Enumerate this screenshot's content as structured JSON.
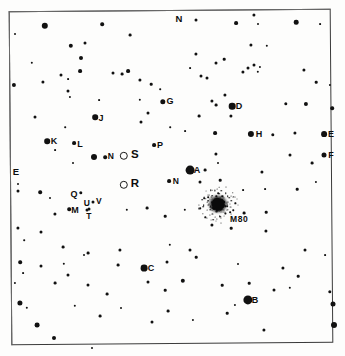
{
  "chart_data": {
    "type": "scatter",
    "xlabel": "",
    "ylabel": "",
    "xlim": [
      0,
      345
    ],
    "ylim": [
      0,
      356
    ],
    "grid": false,
    "legend": "none",
    "orientation_markers": [
      {
        "label": "N",
        "x": 179,
        "y": 19,
        "font_size": 9.5,
        "position": "top-center"
      },
      {
        "label": "E",
        "x": 16,
        "y": 172,
        "font_size": 9.5,
        "position": "left-edge"
      }
    ],
    "deep_sky_objects": [
      {
        "name": "M80",
        "type": "globular-cluster",
        "x": 218,
        "y": 204,
        "label": "M80",
        "label_x": 230,
        "label_y": 214,
        "core_radius": 6.5,
        "halo_radius": 20
      }
    ],
    "comparison_stars": [
      {
        "label": "A",
        "x": 197,
        "y": 170,
        "marker_x": 190,
        "marker_y": 170,
        "marker_size": 4.4,
        "marker": "filled",
        "font_size": 9
      },
      {
        "label": "B",
        "x": 255,
        "y": 300,
        "marker_x": 248,
        "marker_y": 300,
        "marker_size": 4.6,
        "marker": "filled",
        "font_size": 9
      },
      {
        "label": "C",
        "x": 151,
        "y": 268,
        "marker_x": 144,
        "marker_y": 268,
        "marker_size": 3.4,
        "marker": "filled",
        "font_size": 9
      },
      {
        "label": "D",
        "x": 239,
        "y": 106,
        "marker_x": 232,
        "marker_y": 106,
        "marker_size": 3.3,
        "marker": "filled",
        "font_size": 9
      },
      {
        "label": "E",
        "x": 331,
        "y": 134,
        "marker_x": 324,
        "marker_y": 134,
        "marker_size": 2.9,
        "marker": "filled",
        "font_size": 9
      },
      {
        "label": "F",
        "x": 331,
        "y": 155,
        "marker_x": 324,
        "marker_y": 155,
        "marker_size": 2.5,
        "marker": "filled",
        "font_size": 9
      },
      {
        "label": "G",
        "x": 170,
        "y": 101,
        "marker_x": 163,
        "marker_y": 102,
        "marker_size": 2.7,
        "marker": "filled",
        "font_size": 9
      },
      {
        "label": "H",
        "x": 259,
        "y": 134,
        "marker_x": 251,
        "marker_y": 134,
        "marker_size": 3.1,
        "marker": "filled",
        "font_size": 9
      },
      {
        "label": "J",
        "x": 101,
        "y": 118,
        "marker_x": 95,
        "marker_y": 117,
        "marker_size": 2.8,
        "marker": "filled",
        "font_size": 9
      },
      {
        "label": "K",
        "x": 54,
        "y": 141,
        "marker_x": 47,
        "marker_y": 141,
        "marker_size": 2.8,
        "marker": "filled",
        "font_size": 9
      },
      {
        "label": "L",
        "x": 80,
        "y": 144,
        "marker_x": 74,
        "marker_y": 143,
        "marker_size": 1.9,
        "marker": "filled",
        "font_size": 9
      },
      {
        "label": "M",
        "x": 75,
        "y": 210,
        "marker_x": 69,
        "marker_y": 209,
        "marker_size": 1.8,
        "marker": "filled",
        "font_size": 9
      },
      {
        "label": "P",
        "x": 160,
        "y": 145,
        "marker_x": 154,
        "marker_y": 145,
        "marker_size": 1.9,
        "marker": "filled",
        "font_size": 9
      },
      {
        "label": "Q",
        "x": 74,
        "y": 194,
        "marker_x": 81,
        "marker_y": 193,
        "marker_size": 1.7,
        "marker": "filled",
        "font_size": 9
      }
    ],
    "variable_stars": [
      {
        "label": "N",
        "x": 111,
        "y": 156,
        "marker_x": 105,
        "marker_y": 157,
        "marker_size": 1.8,
        "marker": "filled",
        "font_size": 8.5
      },
      {
        "label": "N",
        "x": 176,
        "y": 181,
        "marker_x": 169,
        "marker_y": 181,
        "marker_size": 1.9,
        "marker": "filled",
        "font_size": 8.5
      },
      {
        "label": "S",
        "x": 135,
        "y": 155,
        "marker_x": 124,
        "marker_y": 156,
        "marker_size": 4.2,
        "marker": "open-circle",
        "font_size": 11.5
      },
      {
        "label": "R",
        "x": 135,
        "y": 184,
        "marker_x": 124,
        "marker_y": 185,
        "marker_size": 4.2,
        "marker": "open-circle",
        "font_size": 11.5
      },
      {
        "label": "T",
        "x": 89,
        "y": 216,
        "marker_x": 89,
        "marker_y": 209,
        "marker_size": 1.5,
        "marker": "filled",
        "font_size": 8.5
      },
      {
        "label": "U",
        "x": 87,
        "y": 203,
        "marker_x": 87,
        "marker_y": 210,
        "marker_size": 1.5,
        "marker": "filled",
        "font_size": 8.5
      },
      {
        "label": "V",
        "x": 99,
        "y": 201,
        "marker_x": 93,
        "marker_y": 202,
        "marker_size": 1.5,
        "marker": "filled",
        "font_size": 8.5
      }
    ],
    "field_stars": [
      {
        "x": 45,
        "y": 26,
        "r": 3.2
      },
      {
        "x": 102,
        "y": 24,
        "r": 1.8
      },
      {
        "x": 196,
        "y": 20,
        "r": 1.5
      },
      {
        "x": 236,
        "y": 23,
        "r": 1.9
      },
      {
        "x": 254,
        "y": 15,
        "r": 1.6
      },
      {
        "x": 296,
        "y": 22,
        "r": 2.3
      },
      {
        "x": 320,
        "y": 24,
        "r": 0.9
      },
      {
        "x": 15,
        "y": 34,
        "r": 1.0
      },
      {
        "x": 130,
        "y": 35,
        "r": 1.4
      },
      {
        "x": 71,
        "y": 46,
        "r": 2.2
      },
      {
        "x": 85,
        "y": 43,
        "r": 1.5
      },
      {
        "x": 258,
        "y": 24,
        "r": 1.0
      },
      {
        "x": 251,
        "y": 45,
        "r": 1.6
      },
      {
        "x": 267,
        "y": 46,
        "r": 1.2
      },
      {
        "x": 81,
        "y": 58,
        "r": 2.0
      },
      {
        "x": 80,
        "y": 71,
        "r": 1.9
      },
      {
        "x": 61,
        "y": 75,
        "r": 1.5
      },
      {
        "x": 68,
        "y": 79,
        "r": 0.9
      },
      {
        "x": 14,
        "y": 85,
        "r": 2.1
      },
      {
        "x": 43,
        "y": 82,
        "r": 1.6
      },
      {
        "x": 113,
        "y": 73,
        "r": 1.5
      },
      {
        "x": 140,
        "y": 80,
        "r": 1.6
      },
      {
        "x": 151,
        "y": 84,
        "r": 1.3
      },
      {
        "x": 160,
        "y": 89,
        "r": 0.8
      },
      {
        "x": 122,
        "y": 74,
        "r": 1.4
      },
      {
        "x": 128,
        "y": 71,
        "r": 1.9
      },
      {
        "x": 196,
        "y": 54,
        "r": 1.6
      },
      {
        "x": 216,
        "y": 63,
        "r": 1.5
      },
      {
        "x": 224,
        "y": 59,
        "r": 1.3
      },
      {
        "x": 243,
        "y": 72,
        "r": 1.6
      },
      {
        "x": 248,
        "y": 68,
        "r": 1.5
      },
      {
        "x": 254,
        "y": 65,
        "r": 1.5
      },
      {
        "x": 258,
        "y": 72,
        "r": 1.2
      },
      {
        "x": 260,
        "y": 67,
        "r": 1.1
      },
      {
        "x": 304,
        "y": 70,
        "r": 1.6
      },
      {
        "x": 316,
        "y": 82,
        "r": 1.3
      },
      {
        "x": 330,
        "y": 85,
        "r": 1.1
      },
      {
        "x": 190,
        "y": 68,
        "r": 0.9
      },
      {
        "x": 201,
        "y": 76,
        "r": 1.5
      },
      {
        "x": 207,
        "y": 78,
        "r": 1.5
      },
      {
        "x": 68,
        "y": 91,
        "r": 1.5
      },
      {
        "x": 70,
        "y": 97,
        "r": 1.1
      },
      {
        "x": 35,
        "y": 117,
        "r": 1.5
      },
      {
        "x": 148,
        "y": 113,
        "r": 1.5
      },
      {
        "x": 212,
        "y": 101,
        "r": 1.6
      },
      {
        "x": 216,
        "y": 105,
        "r": 1.4
      },
      {
        "x": 225,
        "y": 95,
        "r": 1.6
      },
      {
        "x": 231,
        "y": 116,
        "r": 1.6
      },
      {
        "x": 199,
        "y": 116,
        "r": 1.4
      },
      {
        "x": 286,
        "y": 104,
        "r": 1.7
      },
      {
        "x": 306,
        "y": 104,
        "r": 2.1
      },
      {
        "x": 185,
        "y": 131,
        "r": 0.9
      },
      {
        "x": 215,
        "y": 133,
        "r": 1.9
      },
      {
        "x": 273,
        "y": 135,
        "r": 1.7
      },
      {
        "x": 55,
        "y": 150,
        "r": 0.9
      },
      {
        "x": 94,
        "y": 157,
        "r": 3.0
      },
      {
        "x": 216,
        "y": 154,
        "r": 1.6
      },
      {
        "x": 312,
        "y": 163,
        "r": 1.4
      },
      {
        "x": 18,
        "y": 184,
        "r": 1.0
      },
      {
        "x": 18,
        "y": 191,
        "r": 1.5
      },
      {
        "x": 40,
        "y": 192,
        "r": 1.8
      },
      {
        "x": 50,
        "y": 198,
        "r": 1.0
      },
      {
        "x": 55,
        "y": 214,
        "r": 1.6
      },
      {
        "x": 127,
        "y": 210,
        "r": 1.2
      },
      {
        "x": 147,
        "y": 208,
        "r": 1.4
      },
      {
        "x": 165,
        "y": 216,
        "r": 1.3
      },
      {
        "x": 185,
        "y": 210,
        "r": 1.2
      },
      {
        "x": 205,
        "y": 170,
        "r": 1.4
      },
      {
        "x": 218,
        "y": 163,
        "r": 1.0
      },
      {
        "x": 220,
        "y": 180,
        "r": 1.3
      },
      {
        "x": 200,
        "y": 182,
        "r": 1.5
      },
      {
        "x": 243,
        "y": 190,
        "r": 0.9
      },
      {
        "x": 262,
        "y": 172,
        "r": 1.6
      },
      {
        "x": 265,
        "y": 189,
        "r": 0.9
      },
      {
        "x": 316,
        "y": 182,
        "r": 1.1
      },
      {
        "x": 244,
        "y": 213,
        "r": 1.4
      },
      {
        "x": 266,
        "y": 212,
        "r": 1.3
      },
      {
        "x": 18,
        "y": 228,
        "r": 1.6
      },
      {
        "x": 41,
        "y": 232,
        "r": 1.5
      },
      {
        "x": 24,
        "y": 240,
        "r": 0.8
      },
      {
        "x": 63,
        "y": 247,
        "r": 1.4
      },
      {
        "x": 84,
        "y": 255,
        "r": 1.0
      },
      {
        "x": 88,
        "y": 253,
        "r": 1.4
      },
      {
        "x": 120,
        "y": 250,
        "r": 1.6
      },
      {
        "x": 170,
        "y": 245,
        "r": 1.2
      },
      {
        "x": 190,
        "y": 250,
        "r": 1.5
      },
      {
        "x": 212,
        "y": 225,
        "r": 1.6
      },
      {
        "x": 231,
        "y": 228,
        "r": 1.3
      },
      {
        "x": 266,
        "y": 231,
        "r": 1.6
      },
      {
        "x": 305,
        "y": 250,
        "r": 1.5
      },
      {
        "x": 20,
        "y": 262,
        "r": 1.8
      },
      {
        "x": 41,
        "y": 266,
        "r": 1.5
      },
      {
        "x": 23,
        "y": 273,
        "r": 0.9
      },
      {
        "x": 64,
        "y": 264,
        "r": 1.2
      },
      {
        "x": 68,
        "y": 275,
        "r": 1.5
      },
      {
        "x": 118,
        "y": 265,
        "r": 1.4
      },
      {
        "x": 167,
        "y": 262,
        "r": 1.5
      },
      {
        "x": 196,
        "y": 257,
        "r": 1.3
      },
      {
        "x": 238,
        "y": 264,
        "r": 1.0
      },
      {
        "x": 283,
        "y": 268,
        "r": 1.6
      },
      {
        "x": 298,
        "y": 276,
        "r": 1.3
      },
      {
        "x": 325,
        "y": 255,
        "r": 0.9
      },
      {
        "x": 15,
        "y": 283,
        "r": 1.1
      },
      {
        "x": 55,
        "y": 283,
        "r": 1.4
      },
      {
        "x": 88,
        "y": 285,
        "r": 1.5
      },
      {
        "x": 107,
        "y": 294,
        "r": 1.4
      },
      {
        "x": 148,
        "y": 282,
        "r": 1.5
      },
      {
        "x": 165,
        "y": 290,
        "r": 1.3
      },
      {
        "x": 183,
        "y": 281,
        "r": 2.2
      },
      {
        "x": 222,
        "y": 285,
        "r": 1.3
      },
      {
        "x": 249,
        "y": 283,
        "r": 1.3
      },
      {
        "x": 274,
        "y": 290,
        "r": 1.5
      },
      {
        "x": 290,
        "y": 288,
        "r": 1.2
      },
      {
        "x": 20,
        "y": 303,
        "r": 2.6
      },
      {
        "x": 27,
        "y": 308,
        "r": 1.2
      },
      {
        "x": 37,
        "y": 325,
        "r": 2.4
      },
      {
        "x": 75,
        "y": 306,
        "r": 1.2
      },
      {
        "x": 100,
        "y": 316,
        "r": 1.4
      },
      {
        "x": 121,
        "y": 308,
        "r": 1.0
      },
      {
        "x": 152,
        "y": 322,
        "r": 1.5
      },
      {
        "x": 168,
        "y": 311,
        "r": 1.4
      },
      {
        "x": 193,
        "y": 320,
        "r": 1.1
      },
      {
        "x": 227,
        "y": 313,
        "r": 1.3
      },
      {
        "x": 235,
        "y": 305,
        "r": 1.1
      },
      {
        "x": 264,
        "y": 330,
        "r": 1.6
      },
      {
        "x": 330,
        "y": 292,
        "r": 1.7
      },
      {
        "x": 333,
        "y": 304,
        "r": 2.5
      },
      {
        "x": 334,
        "y": 325,
        "r": 3.0
      },
      {
        "x": 92,
        "y": 348,
        "r": 1.0
      },
      {
        "x": 54,
        "y": 338,
        "r": 2.0
      },
      {
        "x": 297,
        "y": 189,
        "r": 1.3
      },
      {
        "x": 290,
        "y": 155,
        "r": 1.5
      },
      {
        "x": 332,
        "y": 108,
        "r": 1.8
      },
      {
        "x": 295,
        "y": 133,
        "r": 1.6
      },
      {
        "x": 170,
        "y": 127,
        "r": 0.8
      },
      {
        "x": 140,
        "y": 100,
        "r": 1.2
      },
      {
        "x": 141,
        "y": 122,
        "r": 1.5
      },
      {
        "x": 99,
        "y": 100,
        "r": 0.9
      },
      {
        "x": 65,
        "y": 127,
        "r": 0.8
      },
      {
        "x": 73,
        "y": 163,
        "r": 1.0
      },
      {
        "x": 32,
        "y": 63,
        "r": 1.2
      }
    ]
  }
}
